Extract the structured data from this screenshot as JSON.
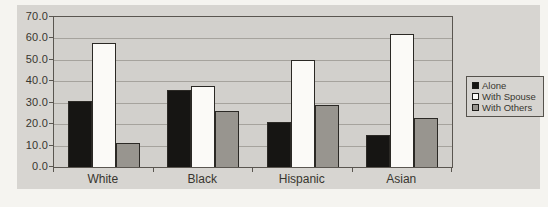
{
  "page": {
    "background": "#f5f4f0"
  },
  "chart": {
    "background": "#d7d5d1",
    "plot_background": "#d2d0cc",
    "gridline_color": "#a6a39d",
    "border_color": "#5a5650",
    "text_color": "#38362f"
  },
  "chart_data": {
    "type": "bar",
    "title": "",
    "xlabel": "",
    "ylabel": "",
    "categories": [
      "White",
      "Black",
      "Hispanic",
      "Asian"
    ],
    "series": [
      {
        "name": "Alone",
        "color": "#161513",
        "values": [
          31,
          36,
          21,
          15
        ]
      },
      {
        "name": "With Spouse",
        "color": "#fbfaf7",
        "values": [
          58,
          38,
          50,
          62
        ]
      },
      {
        "name": "With Others",
        "color": "#98958f",
        "values": [
          11,
          26,
          29,
          23
        ]
      }
    ],
    "ylim": [
      0,
      70
    ],
    "y_tick_step": 10,
    "y_ticks": [
      "70.0",
      "60.0",
      "50.0",
      "40.0",
      "30.0",
      "20.0",
      "10.0",
      "0.0"
    ],
    "grid": true,
    "legend_position": "right"
  }
}
